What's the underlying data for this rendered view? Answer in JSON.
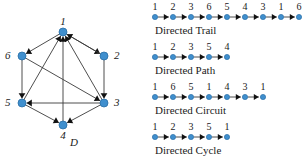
{
  "figure": {
    "graph": {
      "caption": "D",
      "node_color": "#3f8fce",
      "node_stroke": "#2a6ea6",
      "edge_color": "#3a3a3a",
      "nodes": [
        {
          "id": "1",
          "label": "1",
          "x": 63,
          "y": 32,
          "label_x": 63,
          "label_y": 16,
          "label_anchor": "center"
        },
        {
          "id": "2",
          "label": "2",
          "x": 104,
          "y": 56,
          "label_x": 114,
          "label_y": 50,
          "label_anchor": "left"
        },
        {
          "id": "3",
          "label": "3",
          "x": 104,
          "y": 103,
          "label_x": 114,
          "label_y": 97,
          "label_anchor": "left"
        },
        {
          "id": "4",
          "label": "4",
          "x": 63,
          "y": 125,
          "label_x": 63,
          "label_y": 130,
          "label_anchor": "center"
        },
        {
          "id": "5",
          "label": "5",
          "x": 22,
          "y": 103,
          "label_x": 12,
          "label_y": 97,
          "label_anchor": "right"
        },
        {
          "id": "6",
          "label": "6",
          "x": 22,
          "y": 56,
          "label_x": 12,
          "label_y": 50,
          "label_anchor": "right"
        }
      ],
      "edges": [
        {
          "from": "1",
          "to": "2",
          "note": "1 to 2"
        },
        {
          "from": "2",
          "to": "3",
          "note": "2 to 3"
        },
        {
          "from": "3",
          "to": "1",
          "note": "3 to 1"
        },
        {
          "from": "1",
          "to": "6",
          "note": "1 to 6"
        },
        {
          "from": "6",
          "to": "5",
          "note": "6 to 5"
        },
        {
          "from": "5",
          "to": "1",
          "note": "5 to 1"
        },
        {
          "from": "3",
          "to": "5",
          "note": "3 to 5"
        },
        {
          "from": "3",
          "to": "4",
          "note": "3 to 4"
        },
        {
          "from": "5",
          "to": "4",
          "note": "5 to 4"
        },
        {
          "from": "4",
          "to": "1",
          "note": "4 to 1"
        },
        {
          "from": "6",
          "to": "3",
          "note": "6 to 3"
        },
        {
          "from": "2",
          "to": "1",
          "note": "2 to 1 (note on node 2 arrowhead)"
        }
      ]
    },
    "walks": [
      {
        "id": "directed-trail",
        "caption": "Directed Trail",
        "sequence": [
          "1",
          "2",
          "3",
          "6",
          "5",
          "4",
          "3",
          "1",
          "6"
        ],
        "top": 2
      },
      {
        "id": "directed-path",
        "caption": "Directed Path",
        "sequence": [
          "1",
          "2",
          "3",
          "5",
          "4"
        ],
        "top": 42
      },
      {
        "id": "directed-circuit",
        "caption": "Directed Circuit",
        "sequence": [
          "1",
          "6",
          "5",
          "1",
          "4",
          "3",
          "1"
        ],
        "top": 82
      },
      {
        "id": "directed-cycle",
        "caption": "Directed Cycle",
        "sequence": [
          "1",
          "2",
          "3",
          "5",
          "1"
        ],
        "top": 122
      }
    ]
  }
}
